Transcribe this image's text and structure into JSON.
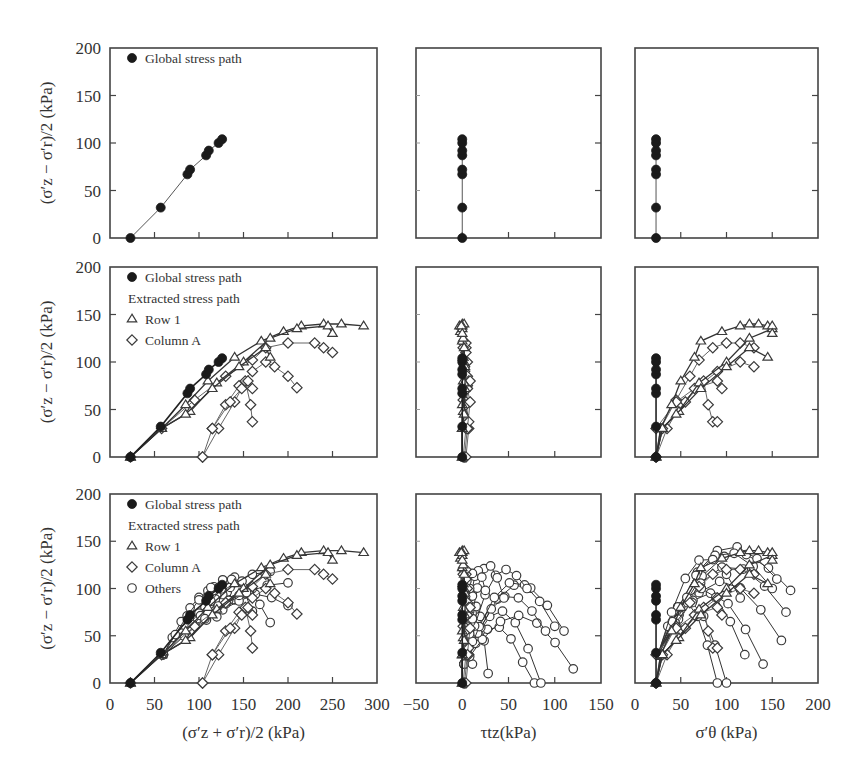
{
  "chart_data": {
    "type": "scatter",
    "layout": "3x3 grid of stress-path plots with shared row y-axes",
    "y_axis": {
      "label": "(σ′z − σ′r)/2 (kPa)",
      "ticks": [
        0,
        50,
        100,
        150,
        200
      ],
      "ylim": [
        0,
        200
      ]
    },
    "x_axes": [
      {
        "column": 1,
        "label": "(σ′z + σ′r)/2 (kPa)",
        "ticks": [
          0,
          50,
          100,
          150,
          200,
          250,
          300
        ],
        "xlim": [
          0,
          300
        ]
      },
      {
        "column": 2,
        "label": "τtz(kPa)",
        "ticks": [
          -50,
          0,
          50,
          100,
          150
        ],
        "xlim": [
          -50,
          150
        ]
      },
      {
        "column": 3,
        "label": "σ′θ (kPa)",
        "ticks": [
          0,
          50,
          100,
          150,
          200
        ],
        "xlim": [
          0,
          200
        ]
      }
    ],
    "legend": {
      "row1": [
        "Global stress path"
      ],
      "row2": [
        "Global stress path",
        "Extracted stress path",
        "Row 1",
        "Column A"
      ],
      "row3": [
        "Global stress path",
        "Extracted stress path",
        "Row 1",
        "Column A",
        "Others"
      ],
      "position": "upper left of column 1"
    },
    "markers": {
      "Global stress path": "filled circle",
      "Row 1": "open triangle",
      "Column A": "open diamond",
      "Others": "open circle"
    },
    "global_stress_path": {
      "p": [
        23,
        57,
        87,
        90,
        108,
        111,
        122,
        126
      ],
      "q": [
        0,
        32,
        67,
        72,
        87,
        92,
        100,
        104
      ],
      "tau": [
        0,
        0,
        0,
        0,
        0,
        0,
        0,
        0
      ],
      "sigma_theta": [
        23,
        23,
        23,
        23,
        23,
        23,
        23,
        23
      ]
    },
    "row1_paths": [
      {
        "p": [
          23,
          58,
          85,
          110,
          140,
          170,
          195,
          215,
          240,
          260,
          285
        ],
        "q": [
          0,
          30,
          55,
          80,
          105,
          122,
          132,
          138,
          140,
          140,
          138
        ],
        "tau": [
          0,
          0,
          0,
          1,
          1,
          0,
          -2,
          -3,
          0,
          2,
          0
        ],
        "sigma_theta": [
          23,
          28,
          40,
          50,
          65,
          72,
          95,
          115,
          125,
          135,
          145
        ]
      },
      {
        "p": [
          23,
          58,
          90,
          120,
          150,
          180,
          210,
          245,
          250
        ],
        "q": [
          0,
          30,
          48,
          78,
          100,
          125,
          135,
          138,
          130
        ],
        "tau": [
          0,
          0,
          1,
          2,
          2,
          1,
          0,
          -1,
          0
        ],
        "sigma_theta": [
          23,
          30,
          48,
          70,
          100,
          125,
          150,
          150,
          150
        ]
      },
      {
        "p": [
          23,
          58,
          85,
          115,
          145,
          175,
          180
        ],
        "q": [
          0,
          30,
          45,
          72,
          95,
          115,
          105
        ],
        "tau": [
          0,
          0,
          2,
          3,
          3,
          2,
          1
        ],
        "sigma_theta": [
          23,
          30,
          45,
          72,
          100,
          125,
          145
        ]
      }
    ],
    "column_a_paths": [
      {
        "p": [
          23,
          58,
          95,
          130,
          160,
          175,
          200,
          230,
          240,
          250
        ],
        "q": [
          0,
          30,
          60,
          85,
          102,
          115,
          120,
          120,
          115,
          110
        ],
        "sigma_theta": [
          23,
          28,
          45,
          60,
          70,
          85,
          100,
          115,
          130
        ]
      },
      {
        "p": [
          104,
          115,
          130,
          145,
          160,
          175,
          185,
          200,
          210
        ],
        "q": [
          0,
          30,
          55,
          75,
          90,
          100,
          95,
          85,
          73
        ],
        "sigma_theta": [
          23,
          35,
          50,
          70,
          90,
          115,
          130
        ]
      },
      {
        "p": [
          104,
          122,
          140,
          152,
          158,
          160
        ],
        "q": [
          0,
          30,
          58,
          80,
          55,
          37
        ],
        "sigma_theta": [
          23,
          30,
          55,
          75,
          80,
          85,
          90
        ]
      },
      {
        "p": [
          115,
          135,
          148,
          155,
          160
        ],
        "q": [
          30,
          58,
          72,
          80,
          72
        ],
        "sigma_theta": [
          23,
          45,
          65,
          90,
          95
        ]
      }
    ],
    "others_tau_endpoints": [
      [
        28,
        30
      ],
      [
        78,
        10
      ],
      [
        85,
        20
      ],
      [
        120,
        35
      ],
      [
        110,
        75
      ],
      [
        90,
        75
      ],
      [
        100,
        80
      ],
      [
        70,
        120
      ],
      [
        45,
        110
      ],
      [
        25,
        118
      ]
    ],
    "others_sigma_theta_endpoints": [
      [
        170,
        98
      ],
      [
        165,
        75
      ],
      [
        155,
        110
      ],
      [
        160,
        45
      ],
      [
        140,
        20
      ],
      [
        150,
        100
      ],
      [
        100,
        0
      ],
      [
        90,
        0
      ],
      [
        120,
        30
      ],
      [
        115,
        90
      ]
    ],
    "grid": false,
    "title": ""
  },
  "figure": {
    "y_axis_label": "(σ′z − σ′r)/2 (kPa)",
    "x_axis_label_col1": "(σ′z + σ′r)/2 (kPa)",
    "x_axis_label_col2": "τtz(kPa)",
    "x_axis_label_col3": "σ′θ (kPa)",
    "legend_global": "Global stress path",
    "legend_extracted": "Extracted stress path",
    "legend_row1": "Row 1",
    "legend_column_a": "Column A",
    "legend_others": "Others"
  }
}
